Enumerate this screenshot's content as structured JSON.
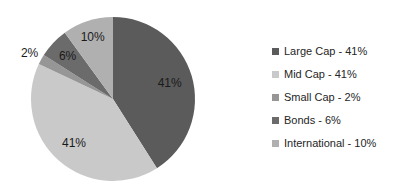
{
  "window": {
    "width": 398,
    "height": 192,
    "background_color": "#FFFFFF"
  },
  "chart_data": {
    "type": "pie",
    "title": "",
    "legend_position": "right",
    "direction": "clockwise",
    "start_angle_deg": 0,
    "total": 100,
    "categories": [
      "Large Cap",
      "Mid Cap",
      "Small Cap",
      "Bonds",
      "International"
    ],
    "values": [
      41,
      41,
      2,
      6,
      10
    ],
    "data_label_color": "#1A1A1A",
    "legend_text_color": "#262626",
    "slices": [
      {
        "name": "Large Cap",
        "value": 41,
        "display": "41%",
        "legend_label": "Large Cap - 41%",
        "color": "#5B5B5B"
      },
      {
        "name": "Mid Cap",
        "value": 41,
        "display": "41%",
        "legend_label": "Mid Cap - 41%",
        "color": "#C9C9C9"
      },
      {
        "name": "Small Cap",
        "value": 2,
        "display": "2%",
        "legend_label": "Small Cap - 2%",
        "color": "#969696"
      },
      {
        "name": "Bonds",
        "value": 6,
        "display": "6%",
        "legend_label": "Bonds - 6%",
        "color": "#6B6B6B"
      },
      {
        "name": "International",
        "value": 10,
        "display": "10%",
        "legend_label": "International - 10%",
        "color": "#B0B0B0"
      }
    ]
  }
}
